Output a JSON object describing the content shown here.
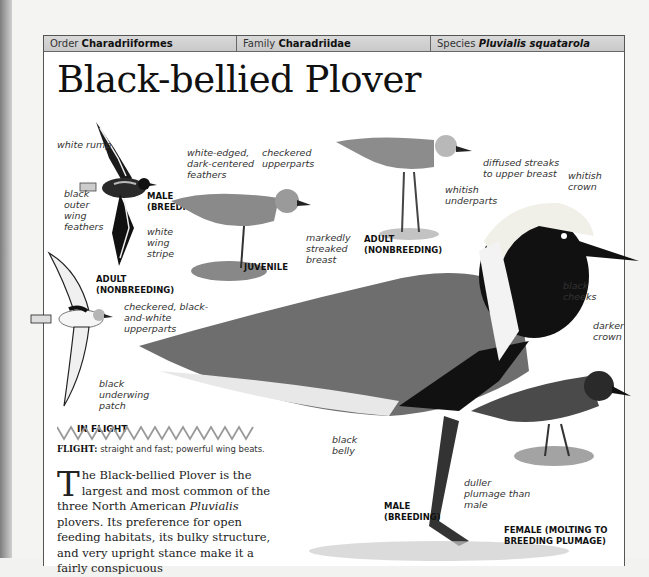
{
  "header": {
    "order_label": "Order",
    "order_value": "Charadriiformes",
    "family_label": "Family",
    "family_value": "Charadriidae",
    "species_label": "Species",
    "species_value": "Pluvialis squatarola"
  },
  "title": "Black-bellied Plover",
  "figures": {
    "male_flight": {
      "caption": "MALE (BREEDING)",
      "labels": [
        "white rump",
        "black outer wing feathers",
        "white wing stripe"
      ]
    },
    "adult_flight": {
      "caption": "ADULT (NONBREEDING)",
      "labels": [
        "black underwing patch"
      ],
      "group_caption": "IN FLIGHT"
    },
    "juvenile": {
      "caption": "JUVENILE",
      "labels": [
        "white-edged, dark-centered feathers",
        "checkered upperparts",
        "markedly streaked breast"
      ]
    },
    "adult_nonbreeding": {
      "caption": "ADULT (NONBREEDING)",
      "labels": [
        "diffused streaks to upper breast",
        "whitish underparts"
      ]
    },
    "male_breeding": {
      "caption": "MALE (BREEDING)",
      "labels": [
        "whitish crown",
        "black cheeks",
        "checkered, black-and-white upperparts",
        "black belly"
      ]
    },
    "female": {
      "caption": "FEMALE (MOLTING TO BREEDING PLUMAGE)",
      "labels": [
        "darker crown",
        "duller plumage than male"
      ]
    }
  },
  "flight": {
    "label": "FLIGHT:",
    "text": "straight and fast; powerful wing beats."
  },
  "body": {
    "dropcap": "T",
    "text_1": "he Black-bellied Plover is the largest and most common of the three North American ",
    "italic": "Pluvialis",
    "text_2": " plovers. Its preference for open feeding habitats, its bulky structure, and very upright stance make it a fairly conspicuous"
  }
}
